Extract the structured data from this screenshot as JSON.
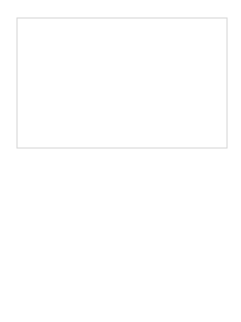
{
  "diagram": {
    "type": "network-graph",
    "frame": {
      "x": 17,
      "y": 18,
      "width": 210,
      "height": 130.5,
      "stroke": "#d6d6d6",
      "fill": "#ffffff"
    },
    "nodes": [
      {
        "id": "top-left",
        "cx": 50,
        "cy": 48,
        "r": 17,
        "inner_r": 9,
        "inner_fill": "#505050",
        "ring": "#7a7a7a"
      },
      {
        "id": "top-right",
        "cx": 187,
        "cy": 48,
        "r": 17,
        "inner_r": 9,
        "inner_fill": "#505050",
        "ring": "#7a7a7a"
      },
      {
        "id": "center",
        "cx": 121,
        "cy": 161,
        "r": 17,
        "inner_r": 0,
        "inner_fill": "none",
        "ring": "#7a7a7a"
      },
      {
        "id": "bottom-left",
        "cx": 50,
        "cy": 279,
        "r": 17,
        "inner_r": 8,
        "inner_fill": "#111111",
        "ring": "#7a7a7a"
      },
      {
        "id": "bottom-right",
        "cx": 193,
        "cy": 279,
        "r": 17,
        "inner_r": 8,
        "inner_fill": "#111111",
        "ring": "#7a7a7a"
      }
    ],
    "edges": [
      {
        "from": "top-left",
        "to": "center"
      },
      {
        "from": "top-right",
        "to": "center"
      },
      {
        "from": "center",
        "to": "bottom-left"
      },
      {
        "from": "center",
        "to": "bottom-right"
      },
      {
        "from": "top-left",
        "to": "bottom-left"
      },
      {
        "from": "top-right",
        "to": "bottom-right"
      },
      {
        "from": "bottom-left",
        "to": "bottom-right"
      }
    ],
    "colors": {
      "line": "#8a8a8a",
      "frame": "#d4d4d4",
      "background": "#ffffff"
    }
  }
}
